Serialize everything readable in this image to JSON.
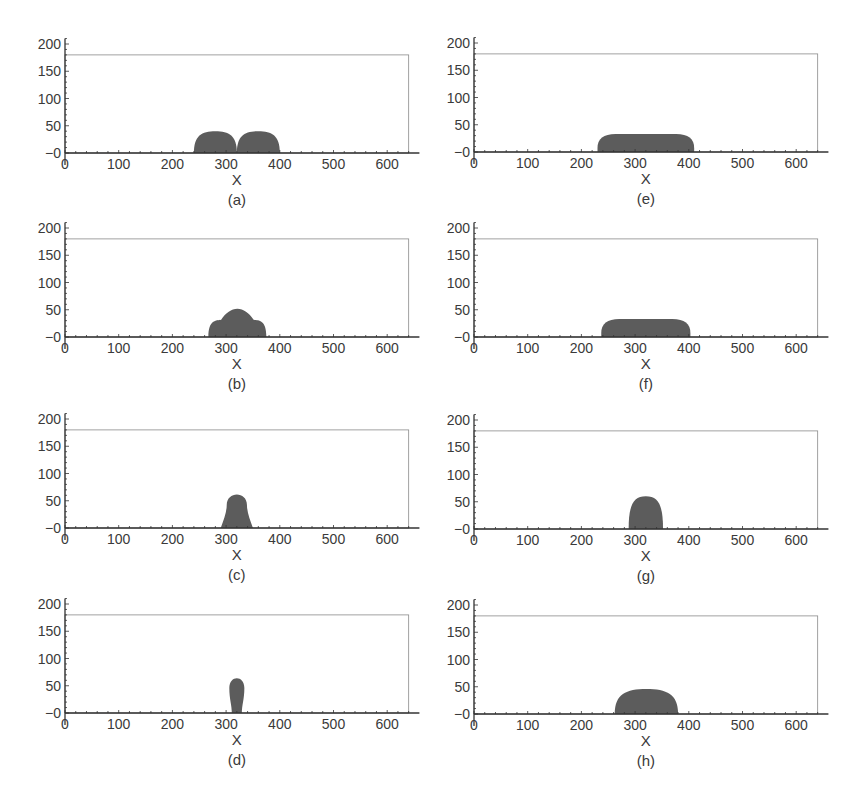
{
  "figure": {
    "panel_labels": [
      "(a)",
      "(b)",
      "(c)",
      "(d)",
      "(e)",
      "(f)",
      "(g)",
      "(h)"
    ],
    "xlabel": "X",
    "x_ticks": [
      "0",
      "100",
      "200",
      "300",
      "400",
      "500",
      "600"
    ],
    "y_ticks": [
      "200",
      "150",
      "100",
      "50",
      "0"
    ],
    "domain_box": {
      "x_max": 640,
      "y_max": 180
    },
    "colors": {
      "droplet": "#5c5c5c",
      "axis": "#333333",
      "box": "#8a8a8a",
      "text": "#3a3a3a"
    }
  },
  "chart_data": [
    {
      "type": "area",
      "panel": "(a)",
      "title": "",
      "xlabel": "X",
      "ylabel": "",
      "xlim": [
        0,
        640
      ],
      "ylim": [
        0,
        200
      ],
      "x_ticks": [
        0,
        100,
        200,
        300,
        400,
        500,
        600
      ],
      "y_ticks": [
        0,
        50,
        100,
        150,
        200
      ],
      "description": "Two adjacent droplets on the wall",
      "shapes": [
        {
          "name": "droplet-1",
          "x": [
            240,
            320
          ],
          "height": 40
        },
        {
          "name": "droplet-2",
          "x": [
            320,
            400
          ],
          "height": 40
        }
      ]
    },
    {
      "type": "area",
      "panel": "(b)",
      "xlabel": "X",
      "xlim": [
        0,
        640
      ],
      "ylim": [
        0,
        200
      ],
      "description": "Merging droplets with central bump",
      "shapes": [
        {
          "name": "merged-droplet",
          "x": [
            267,
            375
          ],
          "height": 52
        }
      ]
    },
    {
      "type": "area",
      "panel": "(c)",
      "xlabel": "X",
      "xlim": [
        0,
        640
      ],
      "ylim": [
        0,
        200
      ],
      "description": "Droplet elongated upward",
      "shapes": [
        {
          "name": "droplet",
          "x": [
            290,
            350
          ],
          "height": 68
        }
      ]
    },
    {
      "type": "area",
      "panel": "(d)",
      "xlabel": "X",
      "xlim": [
        0,
        640
      ],
      "ylim": [
        0,
        200
      ],
      "description": "Droplet with narrow neck (bulb shape)",
      "shapes": [
        {
          "name": "droplet",
          "x": [
            300,
            340
          ],
          "height": 68
        }
      ]
    },
    {
      "type": "area",
      "panel": "(e)",
      "xlabel": "X",
      "xlim": [
        0,
        640
      ],
      "ylim": [
        0,
        200
      ],
      "description": "Flattened merged droplet",
      "shapes": [
        {
          "name": "droplet",
          "x": [
            230,
            410
          ],
          "height": 33
        }
      ]
    },
    {
      "type": "area",
      "panel": "(f)",
      "xlabel": "X",
      "xlim": [
        0,
        640
      ],
      "ylim": [
        0,
        200
      ],
      "description": "Flattened droplet slightly contracting",
      "shapes": [
        {
          "name": "droplet",
          "x": [
            237,
            403
          ],
          "height": 33
        }
      ]
    },
    {
      "type": "area",
      "panel": "(g)",
      "xlabel": "X",
      "xlim": [
        0,
        640
      ],
      "ylim": [
        0,
        200
      ],
      "description": "Tall rounded droplet",
      "shapes": [
        {
          "name": "droplet",
          "x": [
            288,
            352
          ],
          "height": 60
        }
      ]
    },
    {
      "type": "area",
      "panel": "(h)",
      "xlabel": "X",
      "xlim": [
        0,
        640
      ],
      "ylim": [
        0,
        200
      ],
      "description": "Relaxed hemispherical droplet",
      "shapes": [
        {
          "name": "droplet",
          "x": [
            262,
            380
          ],
          "height": 46
        }
      ]
    }
  ]
}
